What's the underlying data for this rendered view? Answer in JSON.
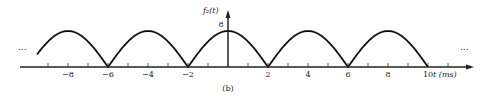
{
  "chart_data": {
    "type": "line",
    "title": "",
    "caption": "(b)",
    "ylabel": "f₂(t)",
    "xlabel": "t (ms)",
    "peak_value": 8,
    "period_ms": 4,
    "zeros": [
      -6,
      -2,
      2,
      6,
      10
    ],
    "x_tick_labels": [
      "-8",
      "-6",
      "-4",
      "-2",
      "2",
      "4",
      "6",
      "8",
      "10"
    ],
    "x_ticks_minor": [
      -9,
      -7,
      -5,
      -3,
      -1,
      1,
      3,
      5,
      7,
      9,
      11
    ],
    "y_tick_labels": [
      "8"
    ],
    "xlim": [
      -10,
      12
    ],
    "ylim": [
      0,
      9
    ],
    "grid": false,
    "legend": null,
    "left_ellipsis": "...",
    "right_ellipsis": "..."
  }
}
